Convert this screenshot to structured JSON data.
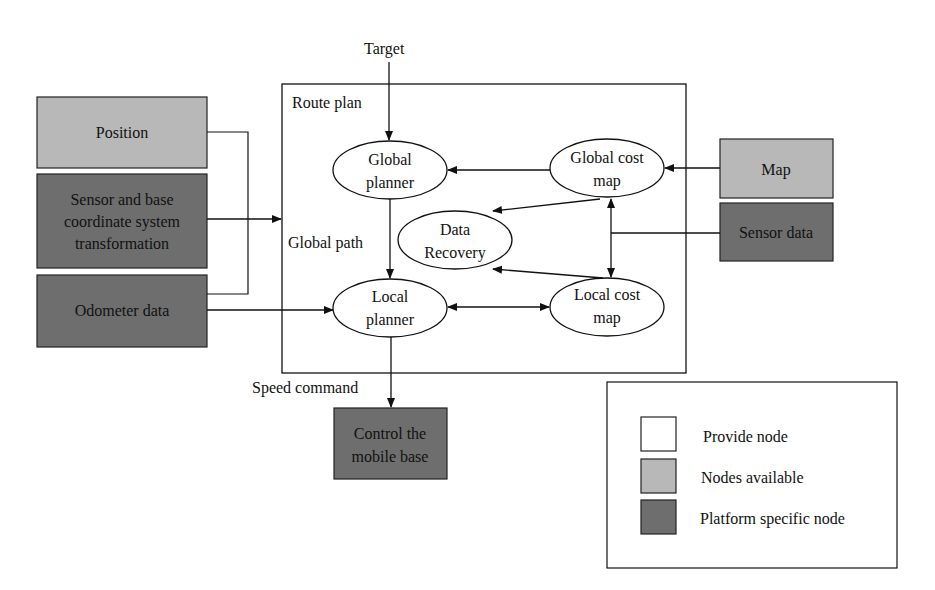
{
  "colors": {
    "provided": "#ffffff",
    "available": "#b8b8b8",
    "platform": "#6e6e6e",
    "line": "#111111"
  },
  "labels": {
    "target": "Target",
    "route_plan": "Route plan",
    "global_path": "Global path",
    "speed_command": "Speed command"
  },
  "left_inputs": {
    "position": [
      "Position"
    ],
    "sensor_transform": [
      "Sensor and base",
      "coordinate system",
      "transformation"
    ],
    "odometer": [
      "Odometer data"
    ]
  },
  "nodes": {
    "global_planner": [
      "Global",
      "planner"
    ],
    "global_cost_map": [
      "Global cost",
      "map"
    ],
    "data_recovery": [
      "Data",
      "Recovery"
    ],
    "local_planner": [
      "Local",
      "planner"
    ],
    "local_cost_map": [
      "Local cost",
      "map"
    ]
  },
  "right_inputs": {
    "map": [
      "Map"
    ],
    "sensor_data": [
      "Sensor data"
    ]
  },
  "output": {
    "control": [
      "Control the",
      "mobile base"
    ]
  },
  "legend": {
    "items": [
      {
        "label": "Provide node",
        "type": "provided"
      },
      {
        "label": "Nodes available",
        "type": "available"
      },
      {
        "label": "Platform specific node",
        "type": "platform"
      }
    ]
  }
}
